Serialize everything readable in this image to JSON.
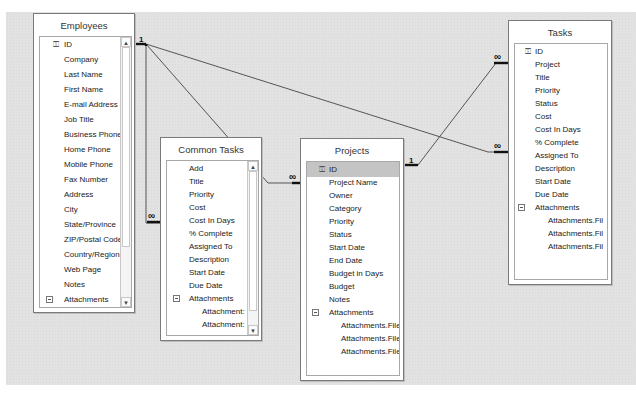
{
  "diagram": {
    "type": "relationships",
    "tables": [
      {
        "name": "Employees",
        "fields": [
          "ID",
          "Company",
          "Last Name",
          "First Name",
          "E-mail Address",
          "Job Title",
          "Business Phone",
          "Home Phone",
          "Mobile Phone",
          "Fax Number",
          "Address",
          "City",
          "State/Province",
          "ZIP/Postal Code",
          "Country/Region",
          "Web Page",
          "Notes",
          "Attachments",
          "Attachments",
          "Attachments",
          "Attachments"
        ],
        "primary_key": "ID",
        "expandable_field": "Attachments"
      },
      {
        "name": "Common Tasks",
        "fields": [
          "Add",
          "Title",
          "Priority",
          "Cost",
          "Cost In Days",
          "% Complete",
          "Assigned To",
          "Description",
          "Start Date",
          "Due Date",
          "Attachments",
          "Attachment:",
          "Attachment:"
        ],
        "expandable_field": "Attachments"
      },
      {
        "name": "Projects",
        "fields": [
          "ID",
          "Project Name",
          "Owner",
          "Category",
          "Priority",
          "Status",
          "Start Date",
          "End Date",
          "Budget in Days",
          "Budget",
          "Notes",
          "Attachments",
          "Attachments.File",
          "Attachments.File",
          "Attachments.File"
        ],
        "primary_key": "ID",
        "selected_field": "ID",
        "expandable_field": "Attachments"
      },
      {
        "name": "Tasks",
        "fields": [
          "ID",
          "Project",
          "Title",
          "Priority",
          "Status",
          "Cost",
          "Cost In Days",
          "% Complete",
          "Assigned To",
          "Description",
          "Start Date",
          "Due Date",
          "Attachments",
          "Attachments.Fil",
          "Attachments.Fil",
          "Attachments.Fil"
        ],
        "primary_key": "ID",
        "expandable_field": "Attachments"
      }
    ],
    "relationships": [
      {
        "from": "Employees.ID",
        "to": "Common Tasks",
        "from_label": "1",
        "to_label": "∞"
      },
      {
        "from": "Employees.ID",
        "to": "Projects",
        "from_label": "1",
        "to_label": "∞"
      },
      {
        "from": "Employees.ID",
        "to": "Tasks",
        "from_label": "1",
        "to_label": "∞"
      },
      {
        "from": "Projects.ID",
        "to": "Tasks.Project",
        "from_label": "1",
        "to_label": "∞"
      }
    ],
    "labels": {
      "one": "1",
      "many": "∞"
    },
    "glyphs": {
      "key": "⚿",
      "scroll_up": "▲",
      "scroll_down": "▼"
    }
  }
}
